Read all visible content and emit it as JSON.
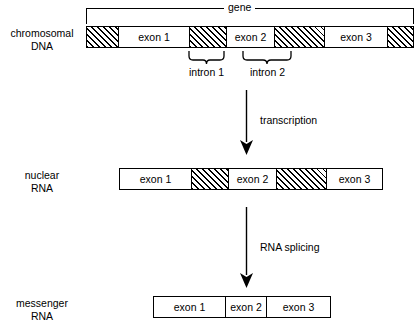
{
  "figure": {
    "ink_color": "#000000",
    "background_color": "#ffffff"
  },
  "gene_bracket": {
    "label": "gene"
  },
  "rows": [
    {
      "id": "chromosomal-dna",
      "label": "chromosomal\nDNA",
      "segments": [
        {
          "kind": "intron",
          "label": ""
        },
        {
          "kind": "exon",
          "label": "exon 1"
        },
        {
          "kind": "intron",
          "label": ""
        },
        {
          "kind": "exon",
          "label": "exon 2"
        },
        {
          "kind": "intron",
          "label": ""
        },
        {
          "kind": "exon",
          "label": "exon 3"
        },
        {
          "kind": "intron",
          "label": ""
        }
      ]
    },
    {
      "id": "nuclear-rna",
      "label": "nuclear\nRNA",
      "segments": [
        {
          "kind": "exon",
          "label": "exon 1"
        },
        {
          "kind": "intron",
          "label": ""
        },
        {
          "kind": "exon",
          "label": "exon 2"
        },
        {
          "kind": "intron",
          "label": ""
        },
        {
          "kind": "exon",
          "label": "exon 3"
        }
      ]
    },
    {
      "id": "messenger-rna",
      "label": "messenger\nRNA",
      "segments": [
        {
          "kind": "exon",
          "label": "exon 1"
        },
        {
          "kind": "exon",
          "label": "exon 2"
        },
        {
          "kind": "exon",
          "label": "exon 3"
        }
      ]
    }
  ],
  "braces": [
    {
      "id": "intron-1",
      "label": "intron 1"
    },
    {
      "id": "intron-2",
      "label": "intron 2"
    }
  ],
  "arrows": [
    {
      "id": "transcription",
      "label": "transcription"
    },
    {
      "id": "rna-splicing",
      "label": "RNA splicing"
    }
  ]
}
